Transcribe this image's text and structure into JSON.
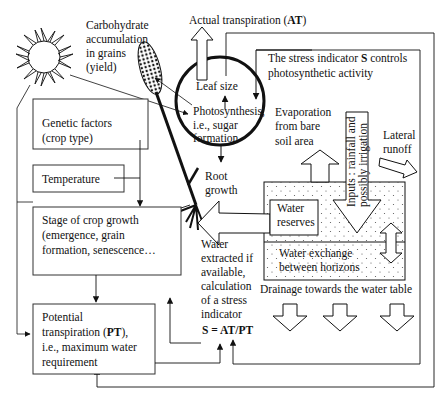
{
  "labels": {
    "carbohydrate": [
      "Carbohydrate",
      "accumulation",
      "in grains",
      "(yield)"
    ],
    "actual_transpiration": "Actual transpiration (",
    "at_abbrev": "AT",
    "close_paren": ")",
    "leaf_size": "Leaf size",
    "photosynthesis": [
      "Photosynthesis,",
      "i.e.,  sugar",
      "formation"
    ],
    "stress_indicator_note_1_pre": "The stress indicator ",
    "stress_indicator_s": "S",
    "stress_indicator_note_1_post": " controls",
    "stress_indicator_note_2": "photosynthetic activity",
    "evaporation": [
      "Evaporation",
      "from bare",
      "soil area"
    ],
    "inputs_vertical": [
      "Inputs : rainfall and",
      "possibly irrigation"
    ],
    "lateral_runoff": [
      "Lateral",
      "runoff"
    ],
    "genetic_factors": [
      "Genetic factors",
      "(crop type)"
    ],
    "temperature": "Temperature",
    "root_growth": [
      "Root",
      "growth"
    ],
    "stage_crop_growth": [
      "Stage of crop growth",
      "(emergence, grain",
      "formation, senescence…"
    ],
    "water_reserves": [
      "Water",
      "reserves"
    ],
    "water_extracted": [
      "Water",
      "extracted if",
      "available,",
      "calculation",
      "of a stress",
      "indicator"
    ],
    "stress_formula": "S = AT/PT",
    "water_exchange": [
      "Water exchange",
      "between horizons"
    ],
    "drainage": "Drainage towards the water table",
    "potential_transpiration": [
      "Potential",
      "transpiration (",
      "PT",
      "),",
      "i.e., maximum water",
      "requirement"
    ]
  },
  "colors": {
    "line": "#111111",
    "background": "#ffffff",
    "box_border": "#333333",
    "outer_frame": "#666666"
  }
}
